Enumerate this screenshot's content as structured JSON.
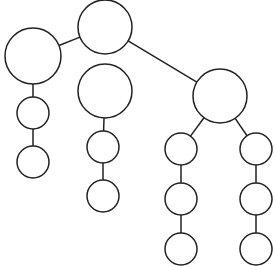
{
  "diagram": {
    "type": "tree",
    "width": 275,
    "height": 266,
    "colors": {
      "background": "#ffffff",
      "stroke": "#222222",
      "fill": "#ffffff"
    },
    "nodes": [
      {
        "id": "root",
        "cx": 105,
        "cy": 27,
        "r": 27
      },
      {
        "id": "left-large",
        "cx": 33,
        "cy": 56,
        "r": 28
      },
      {
        "id": "left-small-1",
        "cx": 33,
        "cy": 113,
        "r": 16
      },
      {
        "id": "left-small-2",
        "cx": 33,
        "cy": 162,
        "r": 16
      },
      {
        "id": "middle-large",
        "cx": 105,
        "cy": 91,
        "r": 27
      },
      {
        "id": "middle-small-1",
        "cx": 103,
        "cy": 147,
        "r": 16
      },
      {
        "id": "middle-small-2",
        "cx": 103,
        "cy": 196,
        "r": 16
      },
      {
        "id": "right-large",
        "cx": 220,
        "cy": 96,
        "r": 27
      },
      {
        "id": "right-left-1",
        "cx": 181,
        "cy": 149,
        "r": 16
      },
      {
        "id": "right-left-2",
        "cx": 181,
        "cy": 199,
        "r": 16
      },
      {
        "id": "right-left-3",
        "cx": 181,
        "cy": 249,
        "r": 16
      },
      {
        "id": "right-right-1",
        "cx": 256,
        "cy": 149,
        "r": 16
      },
      {
        "id": "right-right-2",
        "cx": 256,
        "cy": 199,
        "r": 16
      },
      {
        "id": "right-right-3",
        "cx": 256,
        "cy": 249,
        "r": 16
      }
    ],
    "edges": [
      {
        "from": "root",
        "to": "left-large"
      },
      {
        "from": "root",
        "to": "right-large"
      },
      {
        "from": "left-large",
        "to": "left-small-1"
      },
      {
        "from": "left-small-1",
        "to": "left-small-2"
      },
      {
        "from": "middle-large",
        "to": "middle-small-1"
      },
      {
        "from": "middle-small-1",
        "to": "middle-small-2"
      },
      {
        "from": "right-large",
        "to": "right-left-1"
      },
      {
        "from": "right-left-1",
        "to": "right-left-2"
      },
      {
        "from": "right-left-2",
        "to": "right-left-3"
      },
      {
        "from": "right-large",
        "to": "right-right-1"
      },
      {
        "from": "right-right-1",
        "to": "right-right-2"
      },
      {
        "from": "right-right-2",
        "to": "right-right-3"
      }
    ]
  }
}
